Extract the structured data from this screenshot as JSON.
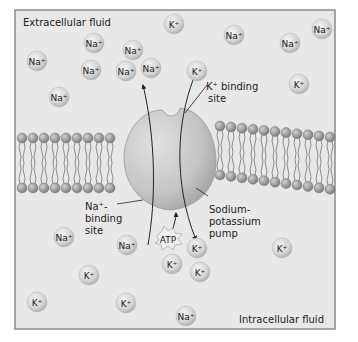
{
  "regions": {
    "extracellular": "Extracellular fluid",
    "intracellular": "Intracellular fluid"
  },
  "labels": {
    "k_binding_line1": "K⁺ binding",
    "k_binding_line2": "site",
    "na_binding_line1": "Na⁺-",
    "na_binding_line2": "binding",
    "na_binding_line3": "site",
    "pump_line1": "Sodium-",
    "pump_line2": "potassium",
    "pump_line3": "pump",
    "atp": "ATP"
  },
  "ions": [
    {
      "label": "K⁺",
      "x": 174,
      "y": 24
    },
    {
      "label": "Na⁺",
      "x": 234,
      "y": 35
    },
    {
      "label": "Na⁺",
      "x": 290,
      "y": 43
    },
    {
      "label": "Na⁺",
      "x": 322,
      "y": 29
    },
    {
      "label": "Na⁺",
      "x": 94,
      "y": 43
    },
    {
      "label": "Na⁺",
      "x": 133,
      "y": 50
    },
    {
      "label": "Na⁺",
      "x": 37,
      "y": 61
    },
    {
      "label": "Na⁺",
      "x": 91,
      "y": 70
    },
    {
      "label": "Na⁺",
      "x": 126,
      "y": 71
    },
    {
      "label": "Na⁺",
      "x": 151,
      "y": 68
    },
    {
      "label": "K⁺",
      "x": 197,
      "y": 71
    },
    {
      "label": "K⁺",
      "x": 299,
      "y": 84
    },
    {
      "label": "Na⁺",
      "x": 59,
      "y": 97
    },
    {
      "label": "K⁺",
      "x": 282,
      "y": 248
    },
    {
      "label": "Na⁺",
      "x": 64,
      "y": 237
    },
    {
      "label": "Na⁺",
      "x": 127,
      "y": 245
    },
    {
      "label": "K⁺",
      "x": 197,
      "y": 248
    },
    {
      "label": "K⁺",
      "x": 89,
      "y": 275
    },
    {
      "label": "K⁺",
      "x": 172,
      "y": 264
    },
    {
      "label": "K⁺",
      "x": 200,
      "y": 272
    },
    {
      "label": "K⁺",
      "x": 37,
      "y": 302
    },
    {
      "label": "K⁺",
      "x": 126,
      "y": 303
    },
    {
      "label": "Na⁺",
      "x": 186,
      "y": 316
    }
  ],
  "colors": {
    "background": "#e8e8e8",
    "frame": "#808080",
    "ion_fill": "#d8d8d8",
    "pump_fill": "#c9c9c9",
    "lipid_head": "#9a9a9a",
    "text": "#222222"
  }
}
